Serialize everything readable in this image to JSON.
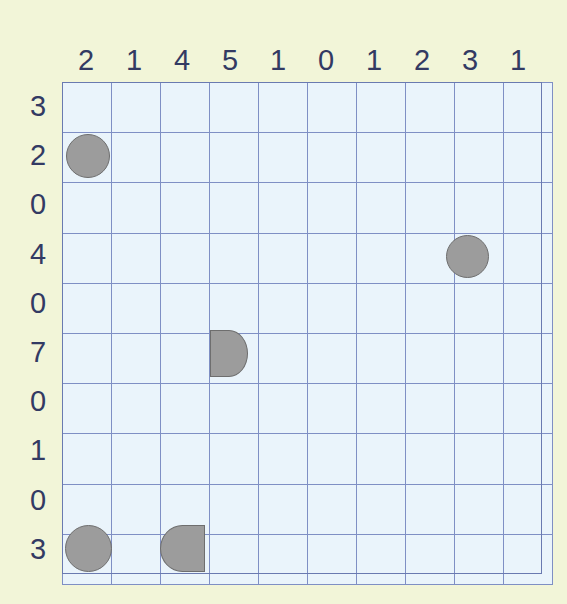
{
  "puzzle": {
    "title": "Grid Puzzle",
    "grid": {
      "columns": 10,
      "rows": 10,
      "cell_width": 48,
      "cell_height": 49.2,
      "cell_fill": "#eaf4fb",
      "gridline_color": "#7f8fc4",
      "border_color": "#6a7ab0"
    },
    "background_color": "#f2f5d8",
    "number_color": "#333a63",
    "shape_fill": "#9c9c9c",
    "shape_stroke": "#6e6e6e",
    "column_headers": [
      "2",
      "1",
      "4",
      "5",
      "1",
      "0",
      "1",
      "2",
      "3",
      "1"
    ],
    "row_headers": [
      "3",
      "2",
      "0",
      "4",
      "0",
      "7",
      "0",
      "1",
      "0",
      "3"
    ],
    "shapes": [
      {
        "name": "circle-r2c1",
        "kind": "circle",
        "row": 1,
        "col": 0,
        "left": 4,
        "top": 52,
        "width": 44,
        "height": 44
      },
      {
        "name": "circle-r4c9",
        "kind": "circle",
        "row": 3,
        "col": 8,
        "left": 384,
        "top": 153,
        "width": 43,
        "height": 43
      },
      {
        "name": "halfdisc-right-r6c4",
        "kind": "d-right",
        "row": 5,
        "col": 3,
        "left": 148,
        "top": 248,
        "width": 38,
        "height": 47
      },
      {
        "name": "circle-r10c1",
        "kind": "circle",
        "row": 9,
        "col": 0,
        "left": 3,
        "top": 443,
        "width": 47,
        "height": 47
      },
      {
        "name": "halfdisc-left-r10c3",
        "kind": "d-left",
        "row": 9,
        "col": 2,
        "left": 98,
        "top": 443,
        "width": 45,
        "height": 47
      }
    ]
  }
}
